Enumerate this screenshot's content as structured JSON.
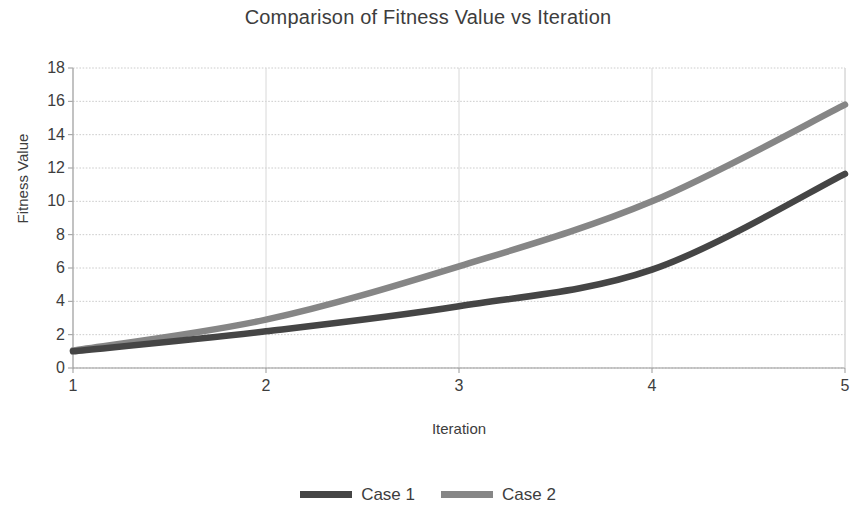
{
  "chart_data": {
    "type": "line",
    "title": "Comparison of Fitness Value vs Iteration",
    "xlabel": "Iteration",
    "ylabel": "Fitness Value",
    "x": [
      1,
      2,
      3,
      4,
      5
    ],
    "xlim": [
      1,
      5
    ],
    "ylim": [
      0,
      18
    ],
    "xticks": [
      "1",
      "2",
      "3",
      "4",
      "5"
    ],
    "yticks": [
      "0",
      "2",
      "4",
      "6",
      "8",
      "10",
      "12",
      "14",
      "16",
      "18"
    ],
    "grid": "horizontal-dotted",
    "legend_position": "bottom-center",
    "series": [
      {
        "name": "Case 1",
        "color": "#454545",
        "values": [
          1.0,
          2.2,
          3.7,
          5.9,
          11.65
        ]
      },
      {
        "name": "Case 2",
        "color": "#868686",
        "values": [
          1.05,
          2.9,
          6.1,
          10.0,
          15.8
        ]
      }
    ]
  },
  "axes": {
    "axis_line_color": "#999999",
    "grid_color": "#cccccc"
  }
}
